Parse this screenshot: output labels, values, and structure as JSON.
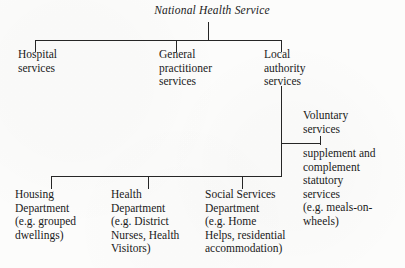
{
  "diagram": {
    "type": "organisational-hierarchy-chart",
    "title": "National Health Service",
    "background_color": "#fcfcfb",
    "line_color": "#262626",
    "nodes": {
      "root": {
        "label": "National Health Service",
        "style": "italic"
      },
      "hospital": {
        "label": "Hospital\nservices"
      },
      "general_practitioner": {
        "label": "General\npractitioner\nservices"
      },
      "local_authority": {
        "label": "Local\nauthority\nservices"
      },
      "voluntary": {
        "label": "Voluntary\nservices"
      },
      "voluntary_detail": {
        "label": "supplement and\ncomplement\nstatutory\nservices\n(e.g. meals-on-\nwheels)"
      },
      "housing": {
        "label": "Housing\nDepartment\n(e.g. grouped\ndwellings)"
      },
      "health": {
        "label": "Health\nDepartment\n(e.g. District\nNurses, Health\nVisitors)"
      },
      "social_services": {
        "label": "Social Services\nDepartment\n(e.g. Home\nHelps, residential\naccommodation)"
      }
    }
  }
}
